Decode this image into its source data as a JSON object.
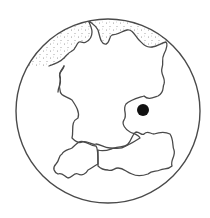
{
  "map": {
    "title": "Central Europe locator map",
    "style": "black-and-white line drawing in a circular frame",
    "colors": {
      "line": "#4a4a4a",
      "sea_stipple": "#8a8a8a",
      "marker": "#111111",
      "background": "#ffffff"
    },
    "frame": {
      "shape": "circle",
      "cx": 108,
      "cy": 111,
      "r": 92
    },
    "regions": [
      {
        "id": "sea",
        "label": "North Sea / Baltic Sea (stippled)"
      },
      {
        "id": "germany",
        "label": "Germany"
      },
      {
        "id": "switzerland",
        "label": "Switzerland"
      },
      {
        "id": "austria",
        "label": "Austria"
      }
    ],
    "marker": {
      "type": "filled-dot",
      "cx": 143,
      "cy": 110,
      "r": 6
    }
  }
}
